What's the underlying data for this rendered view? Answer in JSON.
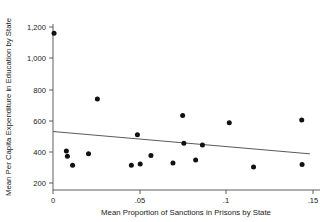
{
  "chart_data": {
    "type": "scatter",
    "title": "",
    "xlabel": "Mean Proportion of Sanctions in Prisons by State",
    "ylabel": "Mean Per Capita Expenditure in Education by State",
    "xlim": [
      -0.004,
      0.152
    ],
    "ylim": [
      170,
      1230
    ],
    "xticks": [
      0,
      0.05,
      0.1,
      0.15
    ],
    "xticklabels": [
      "0",
      ".05",
      ".1",
      ".15"
    ],
    "yticks": [
      200,
      400,
      600,
      800,
      1000,
      1200
    ],
    "yticklabels": [
      "200",
      "400",
      "600",
      "800",
      "1,000",
      "1,200"
    ],
    "grid": false,
    "legend": false,
    "point_color": "#111111",
    "line_color": "#5a5a5a",
    "axis_color": "#4d4d4d",
    "points": [
      {
        "x": 0.0006,
        "y": 1160
      },
      {
        "x": 0.0077,
        "y": 405
      },
      {
        "x": 0.0083,
        "y": 372
      },
      {
        "x": 0.0113,
        "y": 314
      },
      {
        "x": 0.0205,
        "y": 388
      },
      {
        "x": 0.0256,
        "y": 739
      },
      {
        "x": 0.0452,
        "y": 313
      },
      {
        "x": 0.0487,
        "y": 510
      },
      {
        "x": 0.0503,
        "y": 322
      },
      {
        "x": 0.0565,
        "y": 376
      },
      {
        "x": 0.0692,
        "y": 328
      },
      {
        "x": 0.0748,
        "y": 633
      },
      {
        "x": 0.0755,
        "y": 455
      },
      {
        "x": 0.0823,
        "y": 348
      },
      {
        "x": 0.0862,
        "y": 444
      },
      {
        "x": 0.1017,
        "y": 587
      },
      {
        "x": 0.1157,
        "y": 303
      },
      {
        "x": 0.1435,
        "y": 604
      },
      {
        "x": 0.1437,
        "y": 318
      }
    ],
    "fit_line": {
      "name": "linear fit",
      "x_start": 0.0,
      "y_start": 530,
      "x_end": 0.1482,
      "y_end": 387
    }
  }
}
